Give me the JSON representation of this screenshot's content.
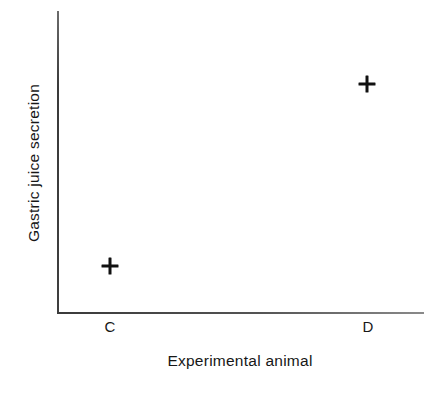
{
  "chart_data": {
    "type": "scatter",
    "title": "",
    "xlabel": "Experimental animal",
    "ylabel": "Gastric juice secretion",
    "categories": [
      "C",
      "D"
    ],
    "values": [
      0.156,
      0.758
    ],
    "series": [
      {
        "name": "Gastric juice secretion",
        "marker": "plus",
        "marker_color": "#111111",
        "points": [
          {
            "category": "C",
            "value": 0.156
          },
          {
            "category": "D",
            "value": 0.758
          }
        ]
      }
    ],
    "xlim": [
      0,
      1
    ],
    "ylim": [
      0,
      1
    ],
    "x_tick_labels": [
      "C",
      "D"
    ],
    "y_tick_labels": [],
    "grid": false,
    "legend": false,
    "legend_position": "none",
    "axis_color": "#4a4a4a",
    "background_color": "#ffffff",
    "annotations": []
  },
  "figure": {
    "x_axis_title": "Experimental animal",
    "y_axis_title": "Gastric juice secretion",
    "ticks": [
      {
        "label": "C",
        "x_pct": 14.4
      },
      {
        "label": "D",
        "x_pct": 84.7
      }
    ],
    "points": [
      {
        "name": "point-c",
        "label": "C",
        "x_pct": 14.4,
        "y_pct": 15.6
      },
      {
        "name": "point-d",
        "label": "D",
        "x_pct": 84.5,
        "y_pct": 75.8
      }
    ]
  }
}
